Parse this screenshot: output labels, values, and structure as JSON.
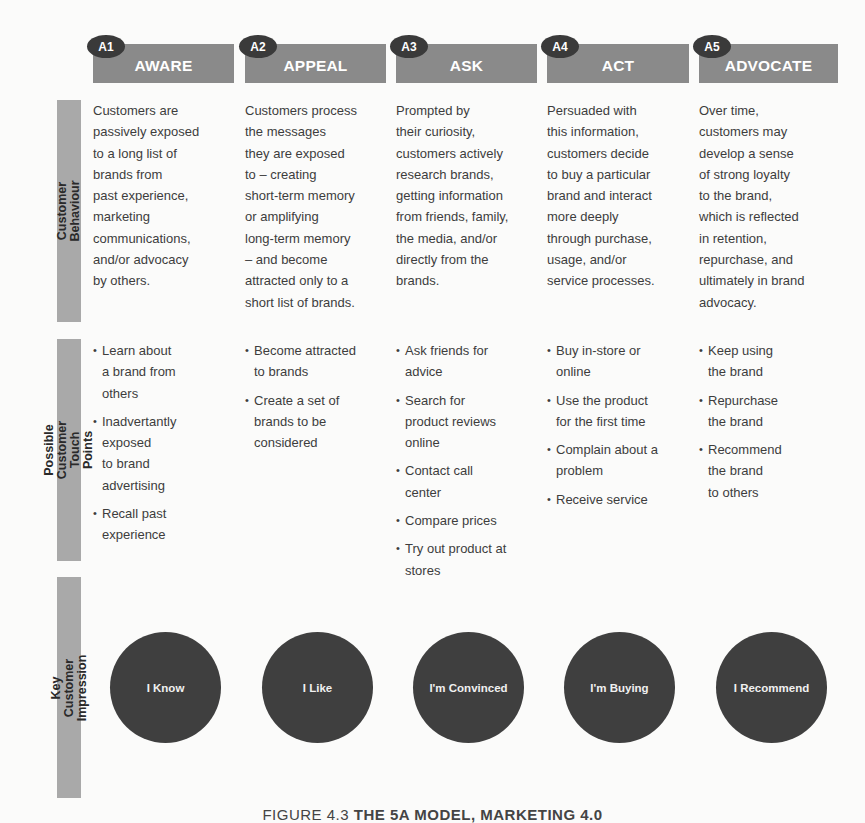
{
  "colors": {
    "header_bg": "#8a8a8a",
    "badge_bg": "#3a3a3a",
    "side_label_bg": "#a9a9a9",
    "circle_bg": "#3f3f3f",
    "text": "#3d3d3d"
  },
  "stages": [
    {
      "badge": "A1",
      "title": "AWARE"
    },
    {
      "badge": "A2",
      "title": "APPEAL"
    },
    {
      "badge": "A3",
      "title": "ASK"
    },
    {
      "badge": "A4",
      "title": "ACT"
    },
    {
      "badge": "A5",
      "title": "ADVOCATE"
    }
  ],
  "rows": {
    "behaviour_label": "Customer\nBehaviour",
    "touch_points_label": "Possible Customer\nTouch Points",
    "impression_label": "Key Customer\nImpression"
  },
  "behaviour": [
    "Customers are\npassively exposed\nto a long list of\nbrands from\npast experience,\nmarketing\ncommunications,\nand/or advocacy\nby others.",
    "Customers process\nthe messages\nthey are exposed\nto – creating\nshort-term memory\nor amplifying\nlong-term memory\n– and become\nattracted only to a\nshort list of brands.",
    "Prompted by\ntheir curiosity,\ncustomers actively\nresearch brands,\ngetting information\nfrom friends, family,\nthe media, and/or\ndirectly from the\nbrands.",
    "Persuaded with\nthis information,\ncustomers decide\nto buy a particular\nbrand and interact\nmore deeply\nthrough purchase,\nusage, and/or\nservice processes.",
    "Over time,\ncustomers may\ndevelop a sense\nof strong loyalty\nto the brand,\nwhich is reflected\nin retention,\nrepurchase, and\nultimately in brand\nadvocacy."
  ],
  "touch_points": [
    [
      "Learn about\na brand from\nothers",
      "Inadvertantly\nexposed\nto brand\nadvertising",
      "Recall past\nexperience"
    ],
    [
      "Become attracted\nto brands",
      "Create a set of\nbrands to be\nconsidered"
    ],
    [
      "Ask friends for\nadvice",
      "Search for\nproduct reviews\nonline",
      "Contact call\ncenter",
      "Compare prices",
      "Try out product at\nstores"
    ],
    [
      "Buy in-store or\nonline",
      "Use the product\nfor the first time",
      "Complain about a\nproblem",
      "Receive service"
    ],
    [
      "Keep using\nthe brand",
      "Repurchase\nthe brand",
      "Recommend\nthe brand\nto others"
    ]
  ],
  "impressions": [
    "I Know",
    "I Like",
    "I'm Convinced",
    "I'm Buying",
    "I Recommend"
  ],
  "caption": {
    "figure": "FIGURE 4.3 ",
    "title": "THE 5A MODEL, MARKETING 4.0"
  }
}
